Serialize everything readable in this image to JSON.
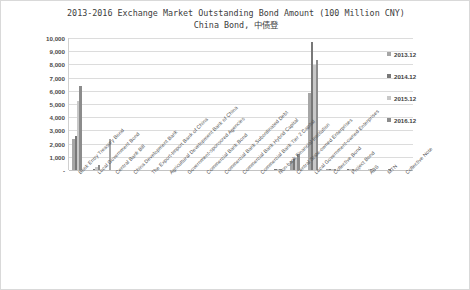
{
  "chart_data": {
    "type": "bar",
    "title": "2013-2016 Exchange Market Outstanding Bond Amount (100 Million CNY)",
    "subtitle": "China Bond, 中债登",
    "xlabel": "",
    "ylabel": "",
    "ylim": [
      0,
      10000
    ],
    "ytick_labels": [
      "10,000",
      "9,000",
      "8,000",
      "7,000",
      "6,000",
      "5,000",
      "4,000",
      "3,000",
      "2,000",
      "1,000",
      "-"
    ],
    "ytick_values": [
      10000,
      9000,
      8000,
      7000,
      6000,
      5000,
      4000,
      3000,
      2000,
      1000,
      0
    ],
    "grid": true,
    "legend_position": "right",
    "categories": [
      "Book Entry Treasury Bond",
      "Local Government Bond",
      "Central Bank Bill",
      "China Development Bank",
      "The Export-Import Bank of China",
      "Agricultural Development Bank of China",
      "Government-sponsored Agencies",
      "Commercial Bank Bond",
      "Commercial Bank Subordinated Debt",
      "Commercial Bank Hybrid Capital",
      "Commercial Bank Tier 2 Capital",
      "Non-bank Financial Institution",
      "Central State-owned Enterprises",
      "Local Government-owned Enterprises",
      "Collective Bond",
      "Project Bond",
      "ABS",
      "MTN",
      "Collective Note"
    ],
    "series": [
      {
        "name": "2013.12",
        "color": "#a6a6a6",
        "values": [
          2350,
          0,
          2350,
          0,
          0,
          0,
          0,
          0,
          0,
          0,
          0,
          0,
          650,
          5850,
          30,
          0,
          0,
          0,
          0
        ]
      },
      {
        "name": "2014.12",
        "color": "#787878",
        "values": [
          2600,
          110,
          0,
          0,
          0,
          0,
          0,
          0,
          0,
          0,
          0,
          20,
          800,
          9700,
          40,
          10,
          0,
          0,
          0
        ]
      },
      {
        "name": "2015.12",
        "color": "#c8c8c8",
        "values": [
          5250,
          250,
          0,
          0,
          0,
          0,
          0,
          0,
          0,
          0,
          0,
          30,
          950,
          7950,
          50,
          20,
          10,
          0,
          0
        ]
      },
      {
        "name": "2016.12",
        "color": "#8c8c8c",
        "values": [
          6350,
          360,
          0,
          0,
          0,
          0,
          0,
          0,
          0,
          0,
          0,
          40,
          1200,
          8300,
          60,
          30,
          20,
          10,
          0
        ]
      }
    ]
  },
  "legend": {
    "entries": [
      "2013.12",
      "2014.12",
      "2015.12",
      "2016.12"
    ]
  }
}
